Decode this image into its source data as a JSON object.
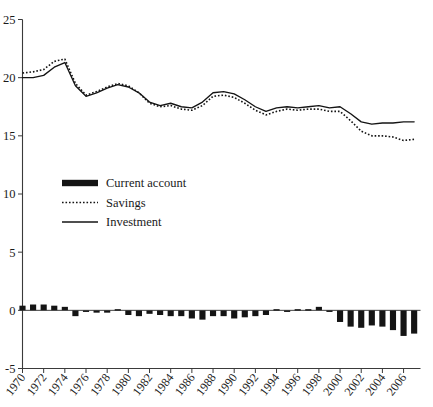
{
  "chart_data": {
    "type": "bar",
    "title": "",
    "subtitle": "",
    "xlabel": "",
    "ylabel": "",
    "xlim": [
      1970,
      2007
    ],
    "ylim": [
      -5,
      25
    ],
    "ytick_values": [
      -5,
      0,
      5,
      10,
      15,
      20,
      25
    ],
    "ytick_labels": [
      "-5",
      "0",
      "5",
      "10",
      "15",
      "20",
      "25"
    ],
    "xtick_values": [
      1970,
      1972,
      1974,
      1976,
      1978,
      1980,
      1982,
      1984,
      1986,
      1988,
      1990,
      1992,
      1994,
      1996,
      1998,
      2000,
      2002,
      2004,
      2006
    ],
    "xtick_labels": [
      "1970",
      "1972",
      "1974",
      "1976",
      "1978",
      "1980",
      "1982",
      "1984",
      "1986",
      "1988",
      "1990",
      "1992",
      "1994",
      "1996",
      "1998",
      "2000",
      "2002",
      "2004",
      "2006"
    ],
    "grid": false,
    "legend_position": "upper-left-inside",
    "x": [
      1970,
      1971,
      1972,
      1973,
      1974,
      1975,
      1976,
      1977,
      1978,
      1979,
      1980,
      1981,
      1982,
      1983,
      1984,
      1985,
      1986,
      1987,
      1988,
      1989,
      1990,
      1991,
      1992,
      1993,
      1994,
      1995,
      1996,
      1997,
      1998,
      1999,
      2000,
      2001,
      2002,
      2003,
      2004,
      2005,
      2006,
      2007
    ],
    "series": [
      {
        "name": "Current account",
        "type": "bar",
        "color": "#141414",
        "values": [
          0.4,
          0.4,
          0.4,
          0.4,
          0.3,
          -0.5,
          -0.2,
          -0.3,
          -0.2,
          0.1,
          -0.4,
          -0.6,
          -0.3,
          -0.4,
          -0.5,
          -0.4,
          -0.7,
          -0.8,
          -0.4,
          -0.4,
          -0.6,
          -0.5,
          -0.4,
          -0.3,
          0.1,
          -0.1,
          0.1,
          0.1,
          0.3,
          -0.1,
          -1.0,
          -1.4,
          -1.5,
          -1.3,
          -1.3,
          -1.7,
          -2.2,
          -2.0
        ]
      },
      {
        "name": "Savings",
        "type": "line",
        "style": "dotted",
        "color": "#141414",
        "values": [
          20.4,
          20.4,
          20.6,
          21.2,
          21.6,
          19.9,
          18.5,
          18.7,
          19.1,
          19.3,
          19.4,
          19.0,
          18.1,
          17.7,
          17.8,
          17.8,
          18.0,
          19.0,
          19.8,
          19.9,
          19.6,
          19.0,
          18.2,
          17.9,
          18.1,
          18.2,
          17.6,
          17.0,
          16.8,
          17.2,
          18.0,
          18.0,
          18.1,
          18.2,
          18.5,
          18.4,
          18.3,
          18.6
        ]
      },
      {
        "name": "Investment",
        "type": "line",
        "style": "solid",
        "color": "#141414",
        "values": [
          20.0,
          20.0,
          20.2,
          20.7,
          21.3,
          19.4,
          18.4,
          18.6,
          19.0,
          19.3,
          19.2,
          18.8,
          18.1,
          17.8,
          17.9,
          17.8,
          18.0,
          19.1,
          19.9,
          20.0,
          19.7,
          19.2,
          18.4,
          18.0,
          18.2,
          18.2,
          17.7,
          17.1,
          17.0,
          17.4,
          18.2,
          18.2,
          18.2,
          18.3,
          18.6,
          18.6,
          18.5,
          18.9
        ]
      }
    ],
    "series_savings_tail": [
      19.3,
      19.7,
      20.3,
      20.3,
      19.9,
      19.2,
      18.6,
      18.3,
      17.8,
      16.6,
      15.6,
      15.0,
      14.9,
      14.7
    ],
    "legend": [
      {
        "label": "Current account",
        "marker": "thick-bar"
      },
      {
        "label": "Savings",
        "marker": "dotted-line"
      },
      {
        "label": "Investment",
        "marker": "solid-line"
      }
    ]
  },
  "series_points": {
    "savings": [
      [
        1970,
        20.4
      ],
      [
        1971,
        20.5
      ],
      [
        1972,
        20.7
      ],
      [
        1973,
        21.4
      ],
      [
        1974,
        21.6
      ],
      [
        1975,
        19.5
      ],
      [
        1976,
        18.5
      ],
      [
        1977,
        18.8
      ],
      [
        1978,
        19.2
      ],
      [
        1979,
        19.5
      ],
      [
        1980,
        19.3
      ],
      [
        1981,
        18.7
      ],
      [
        1982,
        17.8
      ],
      [
        1983,
        17.5
      ],
      [
        1984,
        17.6
      ],
      [
        1985,
        17.3
      ],
      [
        1986,
        17.2
      ],
      [
        1987,
        17.6
      ],
      [
        1988,
        18.4
      ],
      [
        1989,
        18.5
      ],
      [
        1990,
        18.3
      ],
      [
        1991,
        17.8
      ],
      [
        1992,
        17.2
      ],
      [
        1993,
        16.8
      ],
      [
        1994,
        17.1
      ],
      [
        1995,
        17.3
      ],
      [
        1996,
        17.2
      ],
      [
        1997,
        17.3
      ],
      [
        1998,
        17.3
      ],
      [
        1999,
        17.1
      ],
      [
        2000,
        17.1
      ],
      [
        2001,
        16.3
      ],
      [
        2002,
        15.4
      ],
      [
        2003,
        15.0
      ],
      [
        2004,
        15.0
      ],
      [
        2005,
        14.9
      ],
      [
        2006,
        14.6
      ],
      [
        2007,
        14.7
      ]
    ],
    "investment": [
      [
        1970,
        20.0
      ],
      [
        1971,
        20.0
      ],
      [
        1972,
        20.2
      ],
      [
        1973,
        20.9
      ],
      [
        1974,
        21.3
      ],
      [
        1975,
        19.3
      ],
      [
        1976,
        18.4
      ],
      [
        1977,
        18.7
      ],
      [
        1978,
        19.1
      ],
      [
        1979,
        19.4
      ],
      [
        1980,
        19.2
      ],
      [
        1981,
        18.7
      ],
      [
        1982,
        17.9
      ],
      [
        1983,
        17.6
      ],
      [
        1984,
        17.8
      ],
      [
        1985,
        17.5
      ],
      [
        1986,
        17.4
      ],
      [
        1987,
        17.9
      ],
      [
        1988,
        18.7
      ],
      [
        1989,
        18.8
      ],
      [
        1990,
        18.6
      ],
      [
        1991,
        18.1
      ],
      [
        1992,
        17.5
      ],
      [
        1993,
        17.1
      ],
      [
        1994,
        17.4
      ],
      [
        1995,
        17.5
      ],
      [
        1996,
        17.4
      ],
      [
        1997,
        17.5
      ],
      [
        1998,
        17.6
      ],
      [
        1999,
        17.4
      ],
      [
        2000,
        17.5
      ],
      [
        2001,
        16.9
      ],
      [
        2002,
        16.2
      ],
      [
        2003,
        16.0
      ],
      [
        2004,
        16.1
      ],
      [
        2005,
        16.1
      ],
      [
        2006,
        16.2
      ],
      [
        2007,
        16.2
      ]
    ],
    "current_account": [
      [
        1970,
        0.4
      ],
      [
        1971,
        0.5
      ],
      [
        1972,
        0.5
      ],
      [
        1973,
        0.4
      ],
      [
        1974,
        0.3
      ],
      [
        1975,
        -0.5
      ],
      [
        1976,
        -0.1
      ],
      [
        1977,
        -0.2
      ],
      [
        1978,
        -0.2
      ],
      [
        1979,
        0.1
      ],
      [
        1980,
        -0.4
      ],
      [
        1981,
        -0.5
      ],
      [
        1982,
        -0.3
      ],
      [
        1983,
        -0.4
      ],
      [
        1984,
        -0.5
      ],
      [
        1985,
        -0.5
      ],
      [
        1986,
        -0.7
      ],
      [
        1987,
        -0.8
      ],
      [
        1988,
        -0.5
      ],
      [
        1989,
        -0.5
      ],
      [
        1990,
        -0.7
      ],
      [
        1991,
        -0.6
      ],
      [
        1992,
        -0.5
      ],
      [
        1993,
        -0.4
      ],
      [
        1994,
        0.1
      ],
      [
        1995,
        -0.1
      ],
      [
        1996,
        0.1
      ],
      [
        1997,
        0.1
      ],
      [
        1998,
        0.3
      ],
      [
        1999,
        -0.1
      ],
      [
        2000,
        -1.0
      ],
      [
        2001,
        -1.4
      ],
      [
        2002,
        -1.5
      ],
      [
        2003,
        -1.3
      ],
      [
        2004,
        -1.4
      ],
      [
        2005,
        -1.7
      ],
      [
        2006,
        -2.2
      ],
      [
        2007,
        -2.0
      ]
    ]
  }
}
